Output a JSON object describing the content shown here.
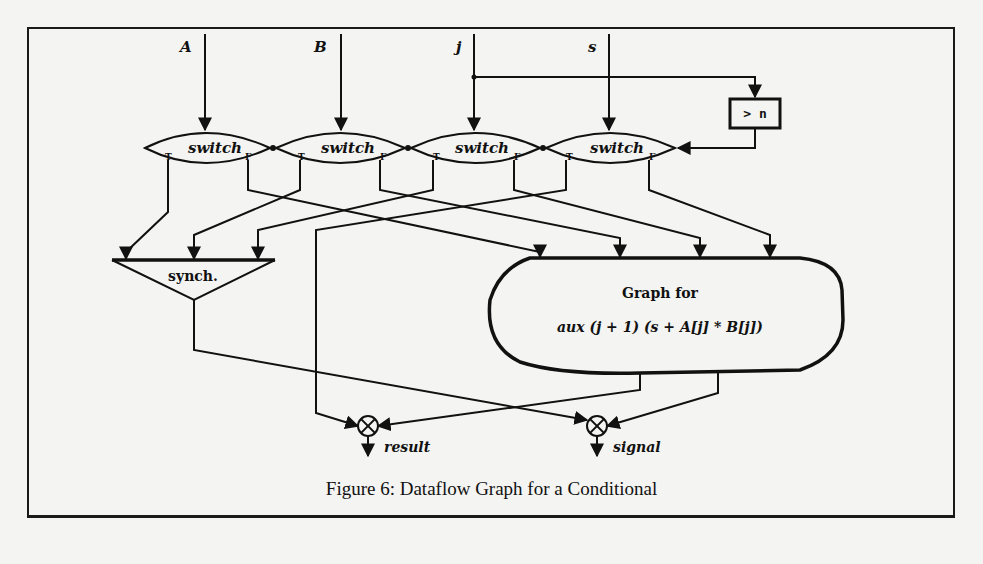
{
  "figure": {
    "caption": "Figure 6: Dataflow Graph for a Conditional",
    "inputs": [
      {
        "id": "A",
        "label": "A"
      },
      {
        "id": "B",
        "label": "B"
      },
      {
        "id": "j",
        "label": "j"
      },
      {
        "id": "s",
        "label": "s"
      }
    ],
    "switches": [
      {
        "label": "switch",
        "true_port": "T",
        "false_port": "F"
      },
      {
        "label": "switch",
        "true_port": "T",
        "false_port": "F"
      },
      {
        "label": "switch",
        "true_port": "T",
        "false_port": "F"
      },
      {
        "label": "switch",
        "true_port": "T",
        "false_port": "F"
      }
    ],
    "comparator": {
      "label": "> n"
    },
    "synch": {
      "label": "synch."
    },
    "subgraph": {
      "title": "Graph for",
      "expression": "aux (j + 1) (s + A[j] * B[j])"
    },
    "outputs": [
      {
        "label": "result"
      },
      {
        "label": "signal"
      }
    ],
    "colors": {
      "ink": "#111111",
      "paper": "#f4f4f2"
    }
  }
}
